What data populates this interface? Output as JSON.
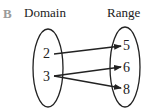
{
  "diagram": {
    "label": "B",
    "domain_title": "Domain",
    "range_title": "Range",
    "domain": [
      "2",
      "3"
    ],
    "range": [
      "5",
      "6",
      "8"
    ],
    "mappings": [
      {
        "from": "2",
        "to": "5"
      },
      {
        "from": "3",
        "to": "6"
      },
      {
        "from": "3",
        "to": "8"
      }
    ],
    "colors": {
      "stroke": "#222222",
      "label_letter": "#9a9a9a"
    }
  }
}
